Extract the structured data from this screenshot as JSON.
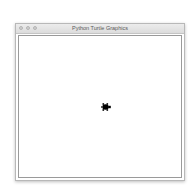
{
  "window": {
    "title": "Python Turtle Graphics",
    "traffic_lights": [
      "close-button",
      "minimize-button",
      "zoom-button"
    ]
  },
  "canvas": {
    "turtle": {
      "shape": "turtle",
      "heading": "right",
      "color": "#000000"
    }
  }
}
